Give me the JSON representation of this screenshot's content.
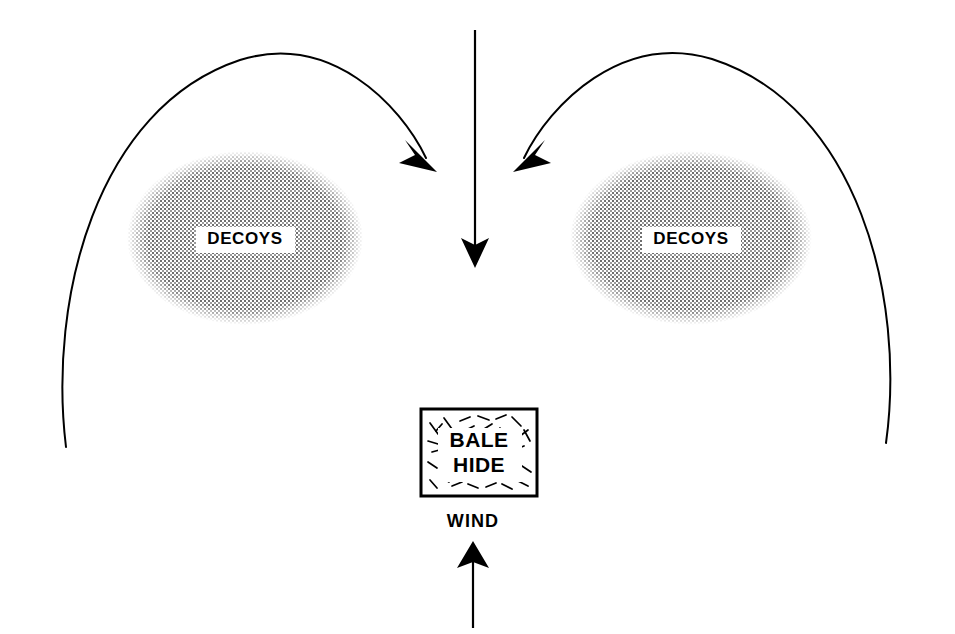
{
  "diagram": {
    "type": "hunting-decoy-spread-layout",
    "background_color": "#ffffff",
    "ink_color": "#000000",
    "stipple_color": "#808080",
    "canvas": {
      "width": 955,
      "height": 634
    },
    "decoy_groups": [
      {
        "id": "left-decoy-spread",
        "label": "DECOYS",
        "shape": "ellipse",
        "fill": "halftone-stipple",
        "cx": 245,
        "cy": 238,
        "rx": 118,
        "ry": 87,
        "label_x": 245,
        "label_y": 244,
        "label_box": {
          "x": 196,
          "y": 227,
          "width": 99,
          "height": 26
        }
      },
      {
        "id": "right-decoy-spread",
        "label": "DECOYS",
        "shape": "ellipse",
        "fill": "halftone-stipple",
        "cx": 691,
        "cy": 238,
        "rx": 121,
        "ry": 87,
        "label_x": 691,
        "label_y": 244,
        "label_box": {
          "x": 642,
          "y": 227,
          "width": 99,
          "height": 26
        }
      }
    ],
    "blind": {
      "id": "bale-hide",
      "label_line1": "BALE",
      "label_line2": "HIDE",
      "shape": "rectangle",
      "fill": "straw-hatch",
      "x": 421,
      "y": 409,
      "width": 116,
      "height": 87,
      "label_x": 479,
      "label_line1_y": 447,
      "label_line2_y": 472
    },
    "wind": {
      "id": "wind-indicator",
      "label": "WIND",
      "label_x": 473,
      "label_y": 527,
      "direction": "up",
      "arrow_x": 473,
      "arrow_tail_y": 628,
      "arrow_tip_y": 541
    },
    "flight_paths": [
      {
        "id": "center-approach-path",
        "style": "straight",
        "direction": "down",
        "x": 475,
        "tail_y": 30,
        "tip_y": 265
      },
      {
        "id": "left-approach-path",
        "style": "curved-arc",
        "direction": "inward-down-right",
        "tail_x": 66,
        "tail_y": 447,
        "tip_x": 434,
        "tip_y": 168,
        "apex_x": 240,
        "apex_y": 47
      },
      {
        "id": "right-approach-path",
        "style": "curved-arc",
        "direction": "inward-down-left",
        "tail_x": 886,
        "tail_y": 443,
        "tip_x": 516,
        "tip_y": 168,
        "apex_x": 710,
        "apex_y": 46
      }
    ]
  }
}
